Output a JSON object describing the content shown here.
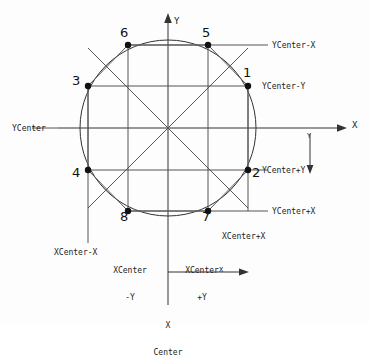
{
  "figure": {
    "type": "geometry-diagram",
    "background_color": "#fdfdfd",
    "stroke_color": "#333333",
    "point_color": "#111111"
  },
  "geometry": {
    "center": {
      "x": 168,
      "y": 128
    },
    "radius": 88,
    "offset_x": 40,
    "offset_y": 80
  },
  "axes": {
    "y_up": {
      "label": "Y"
    },
    "x_right": {
      "label": "X"
    },
    "y_down": {
      "label": "Y"
    },
    "x_bottom": {
      "label": "X"
    }
  },
  "points": [
    {
      "id": "1",
      "label": "1",
      "x": 248,
      "y": 86,
      "num_x": 243,
      "num_y": 66
    },
    {
      "id": "2",
      "label": "2",
      "x": 248,
      "y": 170,
      "num_x": 252,
      "num_y": 166
    },
    {
      "id": "3",
      "label": "3",
      "x": 88,
      "y": 86,
      "num_x": 72,
      "num_y": 74
    },
    {
      "id": "4",
      "label": "4",
      "x": 88,
      "y": 170,
      "num_x": 72,
      "num_y": 166
    },
    {
      "id": "5",
      "label": "5",
      "x": 208,
      "y": 45,
      "num_x": 202,
      "num_y": 26
    },
    {
      "id": "6",
      "label": "6",
      "x": 128,
      "y": 45,
      "num_x": 120,
      "num_y": 26
    },
    {
      "id": "7",
      "label": "7",
      "x": 208,
      "y": 211,
      "num_x": 202,
      "num_y": 210
    },
    {
      "id": "8",
      "label": "8",
      "x": 128,
      "y": 211,
      "num_x": 120,
      "num_y": 210
    }
  ],
  "labels": {
    "y_center": "YCenter",
    "y_center_minus_x": "YCenter-X",
    "y_center_minus_y": "YCenter-Y",
    "y_center_plus_y": "YCenter+Y",
    "y_center_plus_x": "YCenter+X",
    "x_center_minus_x": "XCenter-X",
    "x_center_plus_x": "XCenter+X",
    "x_center_minus_y_line1": "XCenter",
    "x_center_minus_y_line2": "-Y",
    "x_center_plus_y_line1": "XCenter",
    "x_center_plus_y_line2": "+Y",
    "x_center_line1": "X",
    "x_center_line2": "Center"
  }
}
